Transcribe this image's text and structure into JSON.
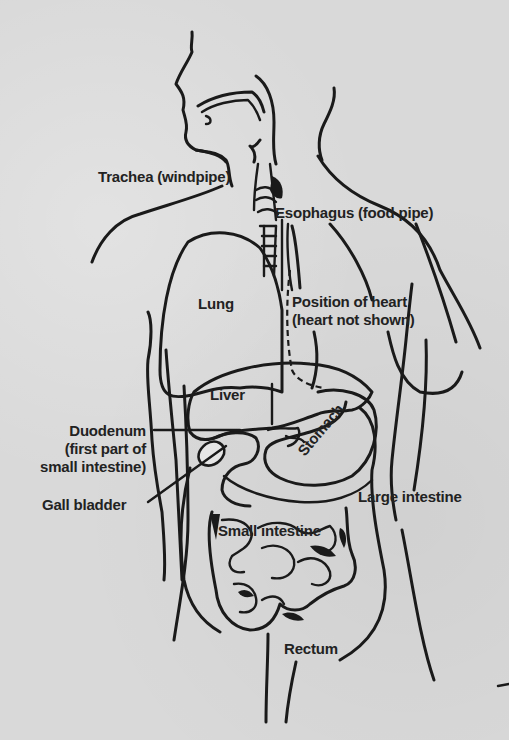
{
  "diagram": {
    "colors": {
      "background": "#d9d9d9",
      "ink": "#1a1a1a"
    },
    "labels": {
      "trachea": "Trachea (windpipe)",
      "esophagus": "Esophagus (food pipe)",
      "lung": "Lung",
      "heart_line1": "Position of heart",
      "heart_line2": "(heart not shown)",
      "liver": "Liver",
      "duodenum_line1": "Duodenum",
      "duodenum_line2": "(first part of",
      "duodenum_line3": "small intestine)",
      "stomach": "Stomach",
      "gall_bladder": "Gall bladder",
      "large_intestine": "Large intestine",
      "small_intestine": "Small intestine",
      "rectum": "Rectum"
    }
  }
}
